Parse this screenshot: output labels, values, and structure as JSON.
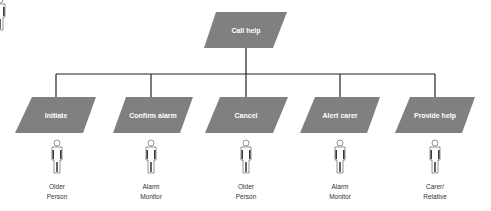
{
  "diagram": {
    "colors": {
      "node_fill": "#808080",
      "connector": "#222222",
      "label_text": "#ffffff",
      "actor_text": "#333333"
    },
    "root": {
      "label": "Call help"
    },
    "children": [
      {
        "label": "Initiate",
        "actor": {
          "line1": "Older",
          "line2": "Person"
        }
      },
      {
        "label": "Confirm alarm",
        "actor": {
          "line1": "Alarm",
          "line2": "Monitor"
        }
      },
      {
        "label": "Cancel",
        "actor": {
          "line1": "Older",
          "line2": "Person"
        }
      },
      {
        "label": "Alert carer",
        "actor": {
          "line1": "Alarm",
          "line2": "Monitor"
        }
      },
      {
        "label": "Provide help",
        "actor": {
          "line1": "Carer/",
          "line2": "Relative"
        }
      }
    ]
  }
}
